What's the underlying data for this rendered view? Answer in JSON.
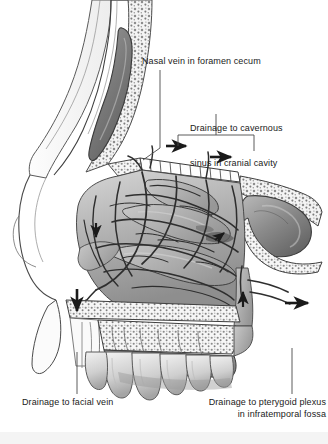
{
  "figure": {
    "background_color": "#ffffff",
    "ink_color": "#1a1a1a",
    "width": 328,
    "height": 444
  },
  "labels": {
    "nasal_vein": "Nasal vein in foramen cecum",
    "cavernous_line1": "Drainage to cavernous",
    "cavernous_line2": "sinus in cranial cavity",
    "facial_vein": "Drainage to facial vein",
    "pterygoid_line1": "Drainage to pterygoid plexus",
    "pterygoid_line2": "in infratemporal fossa"
  },
  "anatomy": {
    "structures": [
      "frontal sinus",
      "nasal bone",
      "cribriform plate",
      "superior concha",
      "middle concha",
      "inferior concha",
      "sphenoid sinus",
      "hard palate",
      "upper teeth",
      "nasal venous plexus",
      "soft palate"
    ]
  },
  "flow_arrows": [
    {
      "name": "arrow-cavernous-anterior",
      "direction": "right"
    },
    {
      "name": "arrow-cavernous-posterior",
      "direction": "right"
    },
    {
      "name": "arrow-facial-descending",
      "direction": "down"
    },
    {
      "name": "arrow-concha-descending",
      "direction": "down"
    },
    {
      "name": "arrow-sphenopalatine-ascending",
      "direction": "up"
    },
    {
      "name": "arrow-pterygoid-posterior",
      "direction": "right"
    }
  ]
}
